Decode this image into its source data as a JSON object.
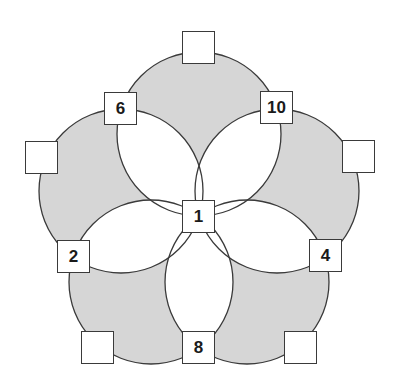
{
  "diagram": {
    "type": "five-circle number puzzle",
    "center": {
      "x": 199,
      "y": 216
    },
    "circle_radius": 82,
    "circle_center_distance": 82,
    "colors": {
      "fill": "#d6d6d6",
      "lens": "#ffffff",
      "stroke": "#3a3a3a"
    },
    "boxes": [
      {
        "id": "center",
        "label": "1",
        "x": 182,
        "y": 200
      },
      {
        "id": "top",
        "label": "",
        "x": 182,
        "y": 31
      },
      {
        "id": "upper-left-inner",
        "label": "6",
        "x": 104,
        "y": 92
      },
      {
        "id": "upper-right-inner",
        "label": "10",
        "x": 260,
        "y": 91
      },
      {
        "id": "left-outer",
        "label": "",
        "x": 25,
        "y": 141
      },
      {
        "id": "right-outer",
        "label": "",
        "x": 342,
        "y": 140
      },
      {
        "id": "lower-left-inner",
        "label": "2",
        "x": 57,
        "y": 240
      },
      {
        "id": "lower-right-inner",
        "label": "4",
        "x": 309,
        "y": 239
      },
      {
        "id": "bottom-left-outer",
        "label": "",
        "x": 81,
        "y": 331
      },
      {
        "id": "bottom-inner",
        "label": "8",
        "x": 182,
        "y": 331
      },
      {
        "id": "bottom-right-outer",
        "label": "",
        "x": 284,
        "y": 331
      }
    ]
  }
}
